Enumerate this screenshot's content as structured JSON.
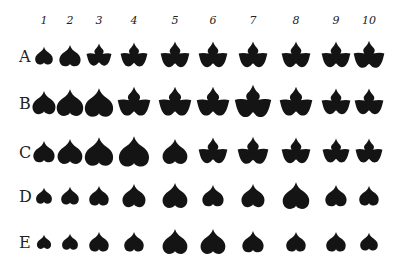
{
  "figure": {
    "columns": [
      "1",
      "2",
      "3",
      "4",
      "5",
      "6",
      "7",
      "8",
      "9",
      "10"
    ],
    "column_x": [
      44,
      70,
      99,
      134,
      175,
      213,
      253,
      296,
      336,
      369
    ],
    "rows": [
      {
        "label": "A",
        "y": 56,
        "leaves": [
          {
            "shape": "heart",
            "size": 20
          },
          {
            "shape": "heart",
            "size": 24
          },
          {
            "shape": "lobed",
            "size": 26
          },
          {
            "shape": "lobed",
            "size": 28
          },
          {
            "shape": "lobed",
            "size": 30
          },
          {
            "shape": "lobed",
            "size": 30
          },
          {
            "shape": "lobed",
            "size": 30
          },
          {
            "shape": "lobed",
            "size": 30
          },
          {
            "shape": "lobed",
            "size": 30
          },
          {
            "shape": "lobed",
            "size": 32
          }
        ]
      },
      {
        "label": "B",
        "y": 103,
        "leaves": [
          {
            "shape": "heart",
            "size": 26
          },
          {
            "shape": "heart",
            "size": 30
          },
          {
            "shape": "heart",
            "size": 32
          },
          {
            "shape": "lobed",
            "size": 34
          },
          {
            "shape": "lobed",
            "size": 34
          },
          {
            "shape": "lobed",
            "size": 34
          },
          {
            "shape": "lobed",
            "size": 38
          },
          {
            "shape": "lobed",
            "size": 34
          },
          {
            "shape": "lobed",
            "size": 30
          },
          {
            "shape": "lobed",
            "size": 30
          }
        ]
      },
      {
        "label": "C",
        "y": 152,
        "leaves": [
          {
            "shape": "heart",
            "size": 24
          },
          {
            "shape": "heart",
            "size": 28
          },
          {
            "shape": "heart",
            "size": 32
          },
          {
            "shape": "heart",
            "size": 34
          },
          {
            "shape": "heart",
            "size": 28
          },
          {
            "shape": "lobed",
            "size": 30
          },
          {
            "shape": "lobed",
            "size": 32
          },
          {
            "shape": "lobed",
            "size": 30
          },
          {
            "shape": "lobed",
            "size": 28
          },
          {
            "shape": "lobed",
            "size": 28
          }
        ]
      },
      {
        "label": "D",
        "y": 196,
        "leaves": [
          {
            "shape": "heart",
            "size": 18
          },
          {
            "shape": "heart",
            "size": 20
          },
          {
            "shape": "heart",
            "size": 22
          },
          {
            "shape": "heart",
            "size": 26
          },
          {
            "shape": "heart",
            "size": 28
          },
          {
            "shape": "heart",
            "size": 24
          },
          {
            "shape": "heart",
            "size": 26
          },
          {
            "shape": "heart",
            "size": 30
          },
          {
            "shape": "heart",
            "size": 24
          },
          {
            "shape": "heart",
            "size": 22
          }
        ]
      },
      {
        "label": "E",
        "y": 242,
        "leaves": [
          {
            "shape": "heart",
            "size": 16
          },
          {
            "shape": "heart",
            "size": 18
          },
          {
            "shape": "heart",
            "size": 22
          },
          {
            "shape": "heart",
            "size": 22
          },
          {
            "shape": "heart",
            "size": 28
          },
          {
            "shape": "heart",
            "size": 28
          },
          {
            "shape": "heart",
            "size": 24
          },
          {
            "shape": "heart",
            "size": 22
          },
          {
            "shape": "heart",
            "size": 22
          },
          {
            "shape": "heart",
            "size": 20
          }
        ]
      }
    ],
    "leaf_color": "#141414"
  }
}
